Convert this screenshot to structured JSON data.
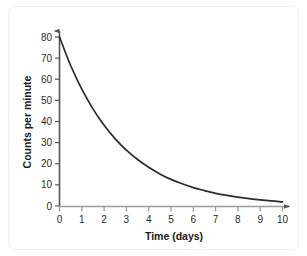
{
  "chart_data": {
    "type": "line",
    "title": "",
    "subtitle": "",
    "xlabel": "Time (days)",
    "ylabel": "Counts per minute",
    "xlim": [
      0,
      10
    ],
    "ylim": [
      0,
      84
    ],
    "xticks": [
      "0",
      "1",
      "2",
      "3",
      "4",
      "5",
      "6",
      "7",
      "8",
      "9",
      "10"
    ],
    "yticks": [
      "0",
      "10",
      "20",
      "30",
      "40",
      "50",
      "60",
      "70",
      "80"
    ],
    "grid": false,
    "legend": null,
    "annotations": [],
    "series": [
      {
        "name": "radioactive decay",
        "color": "#2b2b2b",
        "x": [
          0,
          0.5,
          1,
          1.5,
          2,
          2.5,
          3,
          3.5,
          4,
          4.5,
          5,
          5.5,
          6,
          6.5,
          7,
          7.5,
          8,
          8.5,
          9,
          9.5,
          10
        ],
        "values": [
          80,
          66.5,
          55.3,
          46.0,
          38.2,
          31.8,
          26.4,
          22.0,
          18.3,
          15.2,
          12.6,
          10.5,
          8.7,
          7.3,
          6.0,
          5.0,
          4.2,
          3.5,
          2.9,
          2.4,
          2.0
        ]
      }
    ]
  },
  "axes": {
    "x_title": "Time (days)",
    "y_title": "Counts per minute",
    "x_tick_labels": [
      "0",
      "1",
      "2",
      "3",
      "4",
      "5",
      "6",
      "7",
      "8",
      "9",
      "10"
    ],
    "y_tick_labels": [
      "0",
      "10",
      "20",
      "30",
      "40",
      "50",
      "60",
      "70",
      "80"
    ],
    "axis_color": "#555555",
    "curve_color": "#2b2b2b"
  }
}
